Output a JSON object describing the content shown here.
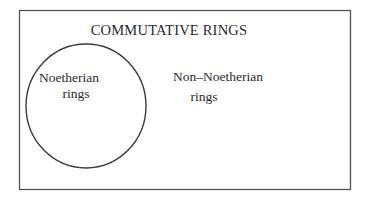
{
  "diagram": {
    "type": "venn",
    "universe": {
      "label": "COMMUTATIVE RINGS",
      "stroke": "#4a4a4a"
    },
    "sets": [
      {
        "label_line1": "Noetherian",
        "label_line2": "rings",
        "shape": "circle",
        "stroke": "#3a3a3a"
      }
    ],
    "complement": {
      "label_line1": "Non–Noetherian",
      "label_line2": "rings"
    }
  }
}
